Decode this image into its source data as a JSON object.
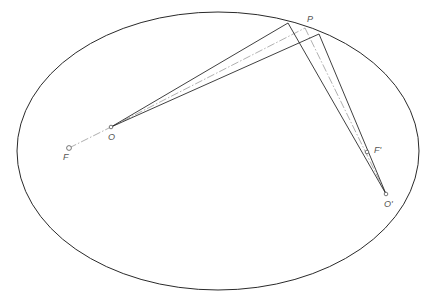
{
  "diagram": {
    "type": "ellipse-reflection-geometry",
    "colors": {
      "background": "#ffffff",
      "ellipse": "#2a2a2a",
      "rays": "#2a2a2a",
      "center_line": "#9a9a9a",
      "labels": "#555555"
    },
    "ellipse": {
      "cx": 218,
      "cy": 151,
      "rx": 201,
      "ry": 139
    },
    "points": [
      {
        "id": "O",
        "label": "O",
        "x": 111,
        "y": 127,
        "label_x": 108,
        "label_y": 140
      },
      {
        "id": "F",
        "label": "F",
        "x": 69,
        "y": 148,
        "label_x": 63,
        "label_y": 160
      },
      {
        "id": "Oprime",
        "label": "O'",
        "x": 386,
        "y": 194,
        "label_x": 384,
        "label_y": 207
      },
      {
        "id": "Fprime",
        "label": "F'",
        "x": 367,
        "y": 152,
        "label_x": 374,
        "label_y": 153
      },
      {
        "id": "P",
        "label": "P",
        "x": 305,
        "y": 28,
        "label_x": 307,
        "label_y": 22
      }
    ],
    "rays": [
      {
        "from": "O",
        "to": [
          288,
          23
        ]
      },
      {
        "from": "O",
        "to": [
          319,
          34
        ]
      },
      {
        "from": "Oprime",
        "to": [
          288,
          23
        ]
      },
      {
        "from": "Oprime",
        "to": [
          319,
          34
        ]
      }
    ],
    "center_lines": [
      {
        "from": "F",
        "to": "O"
      },
      {
        "from": "O",
        "to": "P"
      },
      {
        "from": "P",
        "to": "Oprime"
      }
    ]
  }
}
